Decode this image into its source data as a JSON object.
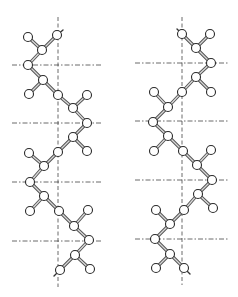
{
  "figure": {
    "colors": {
      "background": "#ffffff",
      "line": "#444444",
      "atom_fill": "#ffffff",
      "atom_stroke": "#2a2a2a"
    },
    "atom_radius": 4.5
  },
  "chains": [
    {
      "name": "left-chain",
      "axis": {
        "x": 58,
        "y1": 17,
        "y2": 287
      },
      "reference_lines": [
        {
          "y": 65,
          "x1": 12,
          "x2": 103
        },
        {
          "y": 123,
          "x1": 12,
          "x2": 103
        },
        {
          "y": 182,
          "x1": 12,
          "x2": 103
        },
        {
          "y": 241,
          "x1": 12,
          "x2": 103
        }
      ],
      "backbone": [
        [
          57,
          35
        ],
        [
          42,
          50
        ],
        [
          28,
          65
        ],
        [
          43,
          80
        ],
        [
          58,
          95
        ],
        [
          73,
          108
        ],
        [
          87,
          123
        ],
        [
          73,
          137
        ],
        [
          58,
          152
        ],
        [
          44,
          166
        ],
        [
          30,
          182
        ],
        [
          44,
          196
        ],
        [
          59,
          211
        ],
        [
          74,
          226
        ],
        [
          89,
          240
        ],
        [
          75,
          255
        ],
        [
          60,
          270
        ]
      ],
      "pendants": [
        {
          "from": 1,
          "to": [
            28,
            37
          ]
        },
        {
          "from": 3,
          "to": [
            29,
            94
          ]
        },
        {
          "from": 5,
          "to": [
            87,
            95
          ]
        },
        {
          "from": 7,
          "to": [
            87,
            151
          ]
        },
        {
          "from": 9,
          "to": [
            29,
            153
          ]
        },
        {
          "from": 11,
          "to": [
            30,
            211
          ]
        },
        {
          "from": 13,
          "to": [
            88,
            210
          ]
        },
        {
          "from": 15,
          "to": [
            90,
            269
          ]
        }
      ],
      "end_ticks": [
        {
          "from": [
            57,
            35
          ],
          "to": [
            63,
            30
          ]
        },
        {
          "from": [
            60,
            270
          ],
          "to": [
            54,
            276
          ]
        }
      ]
    },
    {
      "name": "right-chain",
      "axis": {
        "x": 182,
        "y1": 17,
        "y2": 285
      },
      "reference_lines": [
        {
          "y": 63,
          "x1": 135,
          "x2": 228
        },
        {
          "y": 121,
          "x1": 135,
          "x2": 228
        },
        {
          "y": 180,
          "x1": 135,
          "x2": 228
        },
        {
          "y": 239,
          "x1": 135,
          "x2": 228
        }
      ],
      "backbone": [
        [
          182,
          34
        ],
        [
          196,
          48
        ],
        [
          211,
          63
        ],
        [
          196,
          77
        ],
        [
          182,
          92
        ],
        [
          168,
          107
        ],
        [
          153,
          122
        ],
        [
          168,
          136
        ],
        [
          183,
          151
        ],
        [
          197,
          165
        ],
        [
          212,
          180
        ],
        [
          198,
          194
        ],
        [
          184,
          210
        ],
        [
          170,
          224
        ],
        [
          155,
          239
        ],
        [
          170,
          254
        ],
        [
          184,
          268
        ]
      ],
      "pendants": [
        {
          "from": 1,
          "to": [
            210,
            34
          ]
        },
        {
          "from": 3,
          "to": [
            211,
            92
          ]
        },
        {
          "from": 5,
          "to": [
            154,
            92
          ]
        },
        {
          "from": 7,
          "to": [
            154,
            151
          ]
        },
        {
          "from": 9,
          "to": [
            211,
            150
          ]
        },
        {
          "from": 11,
          "to": [
            213,
            208
          ]
        },
        {
          "from": 13,
          "to": [
            156,
            210
          ]
        },
        {
          "from": 15,
          "to": [
            156,
            268
          ]
        }
      ],
      "end_ticks": [
        {
          "from": [
            182,
            34
          ],
          "to": [
            177,
            29
          ]
        },
        {
          "from": [
            184,
            268
          ],
          "to": [
            190,
            274
          ]
        }
      ]
    }
  ]
}
